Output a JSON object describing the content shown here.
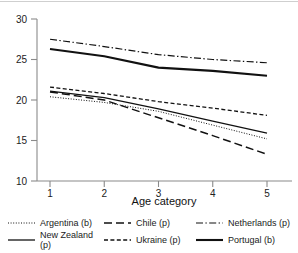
{
  "chart_data": {
    "type": "line",
    "title": "",
    "xlabel": "Age category",
    "ylabel": "",
    "categories": [
      "1",
      "2",
      "3",
      "4",
      "5"
    ],
    "x": [
      1,
      2,
      3,
      4,
      5
    ],
    "xlim": [
      0.7,
      5.35
    ],
    "ylim": [
      10,
      30
    ],
    "yticks": [
      10,
      15,
      20,
      25,
      30
    ],
    "xticks": [
      1,
      2,
      3,
      4,
      5
    ],
    "grid": false,
    "legend_position": "bottom",
    "series": [
      {
        "name": "Argentina (b)",
        "style": "dotted",
        "values": [
          20.4,
          19.7,
          18.6,
          16.9,
          15.2
        ]
      },
      {
        "name": "New Zealand (p)",
        "style": "solid",
        "values": [
          21.1,
          20.3,
          18.9,
          17.4,
          15.9
        ]
      },
      {
        "name": "Chile (p)",
        "style": "long-dash",
        "values": [
          21.0,
          20.0,
          17.8,
          15.6,
          13.3
        ]
      },
      {
        "name": "Ukraine (p)",
        "style": "dashed",
        "values": [
          21.6,
          20.8,
          19.8,
          19.0,
          18.1
        ]
      },
      {
        "name": "Netherlands (p)",
        "style": "dash-dot",
        "values": [
          27.5,
          26.6,
          25.6,
          25.0,
          24.6
        ]
      },
      {
        "name": "Portugal (b)",
        "style": "solid-thick",
        "values": [
          26.3,
          25.4,
          24.0,
          23.6,
          23.0
        ]
      }
    ]
  },
  "axis": {
    "y_tick_labels": [
      "30",
      "25",
      "20",
      "15",
      "10"
    ],
    "x_tick_labels": [
      "1",
      "2",
      "3",
      "4",
      "5"
    ],
    "x_axis_title": "Age category"
  },
  "legend": {
    "entries": [
      {
        "label": "Argentina (b)",
        "style": "dotted"
      },
      {
        "label": "Chile (p)",
        "style": "long-dash"
      },
      {
        "label": "Netherlands (p)",
        "style": "dash-dot"
      },
      {
        "label": "New Zealand (p)",
        "style": "solid"
      },
      {
        "label": "Ukraine (p)",
        "style": "dashed"
      },
      {
        "label": "Portugal (b)",
        "style": "solid-thick"
      }
    ]
  },
  "colors": {
    "line": "#111111",
    "axis": "#8a8a8a",
    "text": "#1a1a1a",
    "background": "#ffffff"
  }
}
